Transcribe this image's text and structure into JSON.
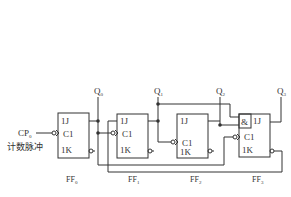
{
  "diagram": {
    "type": "synchronous counter circuit (JK flip-flops)",
    "input": {
      "label": "CP",
      "subscript": "0",
      "caption": "计数脉冲"
    },
    "outputs": [
      {
        "label": "Q",
        "subscript": "0"
      },
      {
        "label": "Q",
        "subscript": "1"
      },
      {
        "label": "Q",
        "subscript": "2"
      },
      {
        "label": "Q",
        "subscript": "3"
      }
    ],
    "flipflops": [
      {
        "name": "FF",
        "subscript": "0",
        "pins": [
          "1J",
          "C1",
          "1K"
        ]
      },
      {
        "name": "FF",
        "subscript": "1",
        "pins": [
          "1J",
          "C1",
          "1K"
        ]
      },
      {
        "name": "FF",
        "subscript": "2",
        "pins": [
          "1J",
          "C1",
          "1K"
        ]
      },
      {
        "name": "FF",
        "subscript": "3",
        "pins": [
          "1J",
          "C1",
          "1K"
        ],
        "gate": "&"
      }
    ],
    "colors": {
      "line": "#333333",
      "background": "#ffffff"
    }
  }
}
